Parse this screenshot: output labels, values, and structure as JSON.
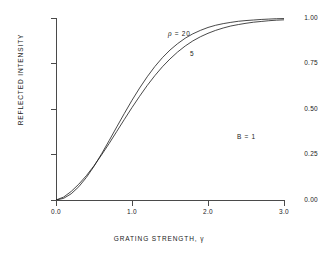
{
  "chart_data": {
    "type": "line",
    "title": "",
    "xlabel": "GRATING STRENGTH, γ",
    "ylabel": "REFLECTED INTENSITY",
    "xlim": [
      0.0,
      3.0
    ],
    "ylim": [
      0.0,
      1.0
    ],
    "grid": false,
    "legend_position": "inline-annotation",
    "xticks": [
      "0.0",
      "1.0",
      "2.0",
      "3.0"
    ],
    "xtick_values": [
      0.0,
      1.0,
      2.0,
      3.0
    ],
    "yticks": [
      "0.00",
      "0.25",
      "0.50",
      "0.75",
      "1.00"
    ],
    "ytick_values": [
      0.0,
      0.25,
      0.5,
      0.75,
      1.0
    ],
    "annotations": [
      {
        "name": "rho-20",
        "text": "ρ = 20",
        "symbol": "ρ",
        "equals": "=",
        "value": "20",
        "x": 1.45,
        "y": 0.9
      },
      {
        "name": "rho-5",
        "text": "5",
        "value": "5",
        "x": 1.75,
        "y": 0.79
      },
      {
        "name": "b-parameter",
        "text": "B = 1",
        "symbol": "B",
        "equals": "=",
        "value": "1",
        "x": 2.35,
        "y": 0.37
      }
    ],
    "x": [
      0.0,
      0.1,
      0.2,
      0.3,
      0.4,
      0.5,
      0.6,
      0.7,
      0.8,
      0.9,
      1.0,
      1.1,
      1.2,
      1.3,
      1.4,
      1.5,
      1.6,
      1.7,
      1.8,
      1.9,
      2.0,
      2.1,
      2.2,
      2.3,
      2.4,
      2.5,
      2.6,
      2.7,
      2.8,
      2.9,
      3.0
    ],
    "series": [
      {
        "name": "ρ = 20",
        "label": "20",
        "color": "#1a1a1a",
        "values": [
          0.0,
          0.009,
          0.034,
          0.073,
          0.124,
          0.185,
          0.254,
          0.327,
          0.402,
          0.476,
          0.548,
          0.615,
          0.677,
          0.733,
          0.782,
          0.824,
          0.859,
          0.889,
          0.913,
          0.932,
          0.948,
          0.96,
          0.969,
          0.976,
          0.982,
          0.986,
          0.989,
          0.992,
          0.994,
          0.996,
          0.997
        ]
      },
      {
        "name": "ρ = 5",
        "label": "5",
        "color": "#1a1a1a",
        "values": [
          0.0,
          0.016,
          0.047,
          0.087,
          0.134,
          0.188,
          0.248,
          0.311,
          0.377,
          0.443,
          0.508,
          0.57,
          0.629,
          0.683,
          0.732,
          0.775,
          0.813,
          0.846,
          0.874,
          0.897,
          0.916,
          0.932,
          0.945,
          0.956,
          0.964,
          0.971,
          0.977,
          0.981,
          0.985,
          0.988,
          0.99
        ]
      }
    ]
  },
  "figure": {
    "background": "#ffffff",
    "axis_color": "#4a4a4a",
    "text_color": "#1a1a1a"
  }
}
